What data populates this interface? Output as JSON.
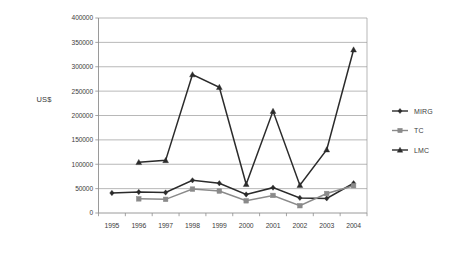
{
  "chart_data": {
    "type": "line",
    "title": "",
    "xlabel": "",
    "ylabel": "US$",
    "categories": [
      "1995",
      "1996",
      "1997",
      "1998",
      "1999",
      "2000",
      "2001",
      "2002",
      "2003",
      "2004"
    ],
    "ylim": [
      0,
      400000
    ],
    "ytick_values": [
      0,
      50000,
      100000,
      150000,
      200000,
      250000,
      300000,
      350000,
      400000
    ],
    "ytick_labels": [
      "0",
      "50000",
      "100000",
      "150000",
      "200000",
      "250000",
      "300000",
      "350000",
      "400000"
    ],
    "grid": true,
    "legend_position": "right",
    "series": [
      {
        "name": "MIRG",
        "marker": "diamond",
        "color": "#2b2b2b",
        "values": [
          41000,
          43000,
          42000,
          67000,
          61000,
          38000,
          52000,
          31000,
          30000,
          61000
        ]
      },
      {
        "name": "TC",
        "marker": "square",
        "color": "#8a8a8a",
        "values": [
          null,
          29000,
          28000,
          49000,
          45000,
          25000,
          36000,
          15000,
          40000,
          56000
        ]
      },
      {
        "name": "LMC",
        "marker": "triangle",
        "color": "#2b2b2b",
        "values": [
          null,
          104000,
          108000,
          284000,
          258000,
          59000,
          209000,
          57000,
          130000,
          335000
        ]
      }
    ]
  },
  "axis_title": {
    "y": "US$"
  },
  "legend": {
    "entries": [
      {
        "label": "MIRG"
      },
      {
        "label": "TC"
      },
      {
        "label": "LMC"
      }
    ]
  },
  "colors": {
    "grid": "#9a9a9a",
    "axis": "#8e8e8e",
    "dark_series": "#2b2b2b",
    "gray_series": "#8a8a8a",
    "text": "#3d3d3d",
    "background": "#ffffff"
  }
}
